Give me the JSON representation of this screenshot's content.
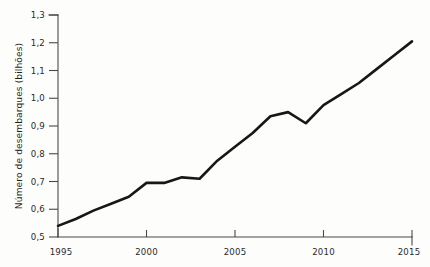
{
  "chart_data": {
    "type": "line",
    "title": "",
    "subtitle": "",
    "xlabel": "",
    "ylabel": "Número de desembarques (bilhões)",
    "xlim": [
      1995,
      2015
    ],
    "ylim": [
      0.5,
      1.3
    ],
    "grid": false,
    "legend": false,
    "legend_position": "none",
    "line_color": "#171717",
    "axis_color": "#4a4a4a",
    "x_tick_labels": [
      "1995",
      "2000",
      "2005",
      "2010",
      "2015"
    ],
    "x_tick_values": [
      1995,
      2000,
      2005,
      2010,
      2015
    ],
    "y_tick_labels": [
      "0,5",
      "0,6",
      "0,7",
      "0,8",
      "0,9",
      "1,0",
      "1,1",
      "1,2",
      "1,3"
    ],
    "y_tick_values": [
      0.5,
      0.6,
      0.7,
      0.8,
      0.9,
      1.0,
      1.1,
      1.2,
      1.3
    ],
    "x": [
      1995,
      1996,
      1997,
      1998,
      1999,
      2000,
      2001,
      2002,
      2003,
      2004,
      2005,
      2006,
      2007,
      2008,
      2009,
      2010,
      2011,
      2012,
      2013,
      2014,
      2015
    ],
    "values": [
      0.54,
      0.565,
      0.595,
      0.62,
      0.645,
      0.695,
      0.695,
      0.715,
      0.71,
      0.775,
      0.825,
      0.875,
      0.935,
      0.95,
      0.91,
      0.975,
      1.015,
      1.055,
      1.105,
      1.155,
      1.205
    ],
    "series": [
      {
        "name": "Número de desembarques",
        "values": [
          0.54,
          0.565,
          0.595,
          0.62,
          0.645,
          0.695,
          0.695,
          0.715,
          0.71,
          0.775,
          0.825,
          0.875,
          0.935,
          0.95,
          0.91,
          0.975,
          1.015,
          1.055,
          1.105,
          1.155,
          1.205
        ]
      }
    ],
    "annotations": []
  }
}
